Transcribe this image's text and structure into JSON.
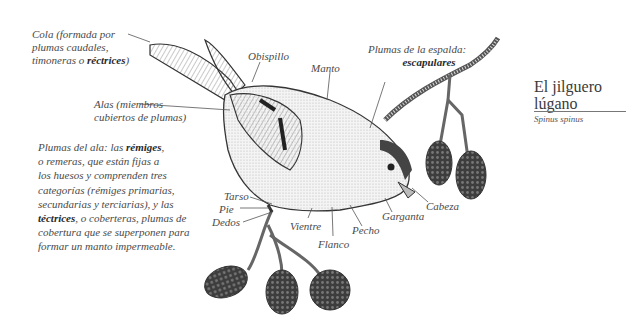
{
  "title": {
    "common_name_line1": "El jilguero",
    "common_name_line2": "lúgano",
    "scientific_name": "Spinus spinus"
  },
  "labels": {
    "cola": {
      "pre": "Cola (formada por",
      "line2": "plumas caudales,",
      "line3_pre": "timoneras o ",
      "line3_bold": "réctrices",
      "line3_post": ")"
    },
    "alas": {
      "line1": "Alas (miembros",
      "line2": "cubiertos de plumas)"
    },
    "obispillo": "Obispillo",
    "manto": "Manto",
    "escapulares": {
      "line1": "Plumas de la espalda:",
      "line2_bold": "escapulares"
    },
    "tarso": "Tarso",
    "pie": "Pie",
    "dedos": "Dedos",
    "vientre": "Vientre",
    "flanco": "Flanco",
    "pecho": "Pecho",
    "garganta": "Garganta",
    "cabeza": "Cabeza"
  },
  "wing_paragraph": {
    "l1_pre": "Plumas del ala: las ",
    "l1_bold": "rémiges",
    "l1_post": ",",
    "l2": "o remeras, que están fijas a",
    "l3": "los huesos y comprenden tres",
    "l4": "categorías (rémiges primarias,",
    "l5": "secundarias y terciarias), y las",
    "l6_bold": "téctrices",
    "l6_post": ", o coberteras, plumas de",
    "l7": "cobertura que se superponen para",
    "l8": "formar un manto impermeable."
  },
  "colors": {
    "ink": "#3a3a3a",
    "text": "#4a4a4a",
    "background": "#ffffff"
  }
}
